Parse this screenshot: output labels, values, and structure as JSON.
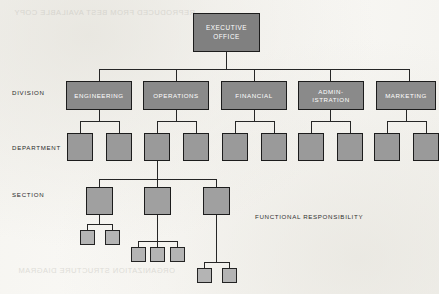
{
  "diagram": {
    "type": "organization-chart",
    "annotation": "FUNCTIONAL RESPONSIBILITY",
    "colors": {
      "page_background": "#f7f6f3",
      "box_fill_executive": "#808080",
      "box_fill_division": "#8a8a8a",
      "box_fill_department": "#9a9a9a",
      "box_fill_section": "#a0a0a0",
      "box_fill_subsection": "#b4b4b4",
      "box_border": "#1c1c1c",
      "connector": "#262626",
      "label_text": "#2a2a2a",
      "box_text": "#ffffff"
    },
    "row_labels": [
      {
        "id": "division",
        "label": "DIVISION"
      },
      {
        "id": "department",
        "label": "DEPARTMENT"
      },
      {
        "id": "section",
        "label": "SECTION"
      }
    ],
    "executive": {
      "line1": "EXECUTIVE",
      "line2": "OFFICE"
    },
    "divisions": [
      {
        "id": "engineering",
        "line1": "ENGINEERING",
        "line2": "",
        "departments": 2
      },
      {
        "id": "operations",
        "line1": "OPERATIONS",
        "line2": "",
        "departments": 2
      },
      {
        "id": "financial",
        "line1": "FINANCIAL",
        "line2": "",
        "departments": 2
      },
      {
        "id": "administration",
        "line1": "ADMIN-",
        "line2": "ISTRATION",
        "departments": 2
      },
      {
        "id": "marketing",
        "line1": "MARKETING",
        "line2": "",
        "departments": 2
      }
    ],
    "sections": [
      {
        "id": "section-1",
        "subsections": 2
      },
      {
        "id": "section-2",
        "subsections": 3
      },
      {
        "id": "section-3",
        "subsections": 2
      }
    ],
    "ghost_text": {
      "top": "REPRODUCED FROM BEST AVAILABLE COPY",
      "bottom": "ORGANIZATION STRUCTURE DIAGRAM"
    }
  }
}
